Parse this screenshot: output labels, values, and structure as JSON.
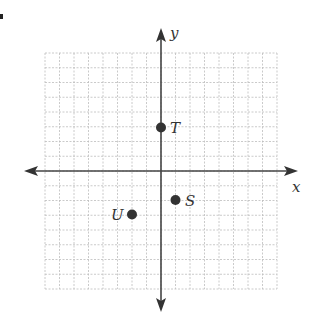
{
  "diagram": {
    "type": "coordinate-plane",
    "axes": {
      "x_label": "x",
      "y_label": "y",
      "range_min": -8,
      "range_max": 8
    },
    "grid": {
      "spacing_px": 14.5,
      "origin_px": [
        161,
        171
      ],
      "left_px": 45,
      "top_px": 53,
      "right_px": 277,
      "bottom_px": 289
    },
    "points": [
      {
        "name": "T",
        "x": 0,
        "y": 3
      },
      {
        "name": "S",
        "x": 1,
        "y": -2
      },
      {
        "name": "U",
        "x": -2,
        "y": -3
      }
    ],
    "colors": {
      "grid": "#bdbdbd",
      "axis": "#444444",
      "point": "#333333"
    }
  }
}
